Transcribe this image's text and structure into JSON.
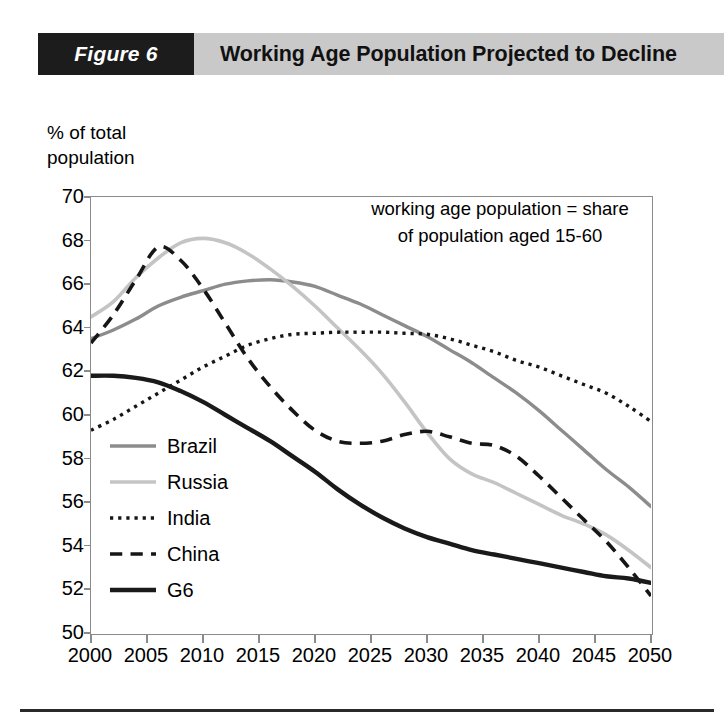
{
  "header": {
    "figure_number": "Figure 6",
    "title": "Working Age Population Projected to Decline",
    "number_box_color": "#1c1c1c",
    "title_box_color": "#c9c9c9"
  },
  "chart_data": {
    "type": "line",
    "title": "Working Age Population Projected to Decline",
    "annotation": "working age population = share\nof population aged 15-60",
    "ylabel": "% of total\npopulation",
    "xlabel": "",
    "ylim": [
      50,
      70
    ],
    "xlim": [
      2000,
      2050
    ],
    "yticks": [
      50,
      52,
      54,
      56,
      58,
      60,
      62,
      64,
      66,
      68,
      70
    ],
    "xticks": [
      2000,
      2005,
      2010,
      2015,
      2020,
      2025,
      2030,
      2035,
      2040,
      2045,
      2050
    ],
    "grid": false,
    "legend_position": "inside-left-lower",
    "x": [
      2000,
      2002,
      2004,
      2006,
      2008,
      2010,
      2012,
      2014,
      2016,
      2018,
      2020,
      2022,
      2024,
      2026,
      2028,
      2030,
      2032,
      2034,
      2036,
      2038,
      2040,
      2042,
      2044,
      2046,
      2048,
      2050
    ],
    "series": [
      {
        "name": "Brazil",
        "color": "#8c8c8c",
        "style": "solid",
        "width": 3.4,
        "values": [
          63.5,
          63.9,
          64.4,
          65.0,
          65.4,
          65.7,
          66.0,
          66.15,
          66.2,
          66.1,
          65.9,
          65.5,
          65.1,
          64.6,
          64.1,
          63.6,
          63.0,
          62.4,
          61.7,
          61.0,
          60.2,
          59.3,
          58.4,
          57.5,
          56.7,
          55.8
        ]
      },
      {
        "name": "Russia",
        "color": "#c4c4c4",
        "style": "solid",
        "width": 3.6,
        "values": [
          64.5,
          65.2,
          66.3,
          67.2,
          67.9,
          68.1,
          67.9,
          67.4,
          66.7,
          65.9,
          65.0,
          64.0,
          63.0,
          61.9,
          60.6,
          59.2,
          58.0,
          57.3,
          56.9,
          56.4,
          55.9,
          55.4,
          55.0,
          54.5,
          53.8,
          53.0
        ]
      },
      {
        "name": "India",
        "color": "#161616",
        "style": "dotted",
        "width": 3.4,
        "values": [
          59.3,
          59.8,
          60.4,
          61.0,
          61.6,
          62.2,
          62.7,
          63.2,
          63.5,
          63.7,
          63.75,
          63.8,
          63.8,
          63.8,
          63.75,
          63.7,
          63.5,
          63.2,
          62.9,
          62.5,
          62.2,
          61.8,
          61.4,
          61.0,
          60.4,
          59.7
        ]
      },
      {
        "name": "China",
        "color": "#161616",
        "style": "dashed",
        "width": 3.6,
        "values": [
          63.3,
          64.6,
          66.2,
          67.7,
          67.1,
          65.8,
          64.2,
          62.6,
          61.3,
          60.2,
          59.3,
          58.8,
          58.7,
          58.8,
          59.1,
          59.25,
          59.0,
          58.7,
          58.6,
          58.1,
          57.2,
          56.2,
          55.2,
          54.2,
          53.0,
          51.7
        ]
      },
      {
        "name": "G6",
        "color": "#1a1a1a",
        "style": "solid",
        "width": 4.4,
        "values": [
          61.8,
          61.8,
          61.7,
          61.5,
          61.1,
          60.6,
          60.0,
          59.4,
          58.8,
          58.1,
          57.4,
          56.6,
          55.9,
          55.3,
          54.8,
          54.4,
          54.1,
          53.8,
          53.6,
          53.4,
          53.2,
          53.0,
          52.8,
          52.6,
          52.5,
          52.3
        ]
      }
    ]
  }
}
